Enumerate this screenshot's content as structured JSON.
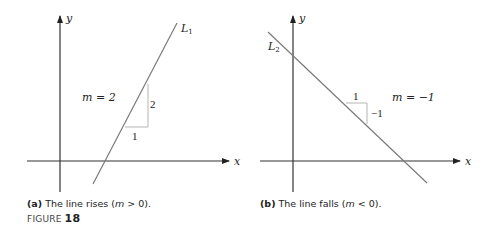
{
  "panel_a": {
    "axis_x_label": "x",
    "axis_y_label": "y",
    "line_label": "L",
    "line_label_sub": "1",
    "slope_label": "m = 2",
    "run_label": "1",
    "rise_label": "2",
    "caption_tag": "(a)",
    "caption_text_1": " The line rises (",
    "caption_m": "m",
    "caption_text_2": " > 0)."
  },
  "panel_b": {
    "axis_x_label": "x",
    "axis_y_label": "y",
    "line_label": "L",
    "line_label_sub": "2",
    "slope_label": "m = −1",
    "run_label": "1",
    "rise_label": "−1",
    "caption_tag": "(b)",
    "caption_text_1": " The line falls (",
    "caption_m": "m",
    "caption_text_2": " < 0)."
  },
  "figure": {
    "prefix": "FIGURE ",
    "number": "18"
  },
  "colors": {
    "axis": "#333333",
    "line": "#7a7a7a",
    "triangle": "#b5b5b5"
  }
}
